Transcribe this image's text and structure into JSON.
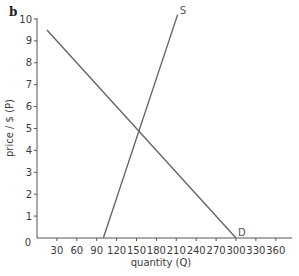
{
  "panel_label": "b",
  "chart_data": {
    "type": "line",
    "title": "",
    "xlabel": "quantity (Q)",
    "ylabel": "price / $ (P)",
    "xlim": [
      0,
      380
    ],
    "ylim": [
      0,
      10
    ],
    "x_ticks": [
      30,
      60,
      90,
      120,
      150,
      180,
      210,
      240,
      270,
      300,
      330,
      360
    ],
    "y_ticks": [
      0,
      1,
      2,
      3,
      4,
      5,
      6,
      7,
      8,
      9,
      10
    ],
    "grid": false,
    "legend": "none",
    "series": [
      {
        "name": "D",
        "points": [
          [
            15,
            9.5
          ],
          [
            300,
            0
          ]
        ],
        "label_at": [
          300,
          0
        ]
      },
      {
        "name": "S",
        "points": [
          [
            100,
            0
          ],
          [
            212,
            10.2
          ]
        ],
        "label_at": [
          212,
          10.2
        ]
      }
    ],
    "equilibrium": {
      "Q": 155,
      "P": 4.8
    }
  }
}
